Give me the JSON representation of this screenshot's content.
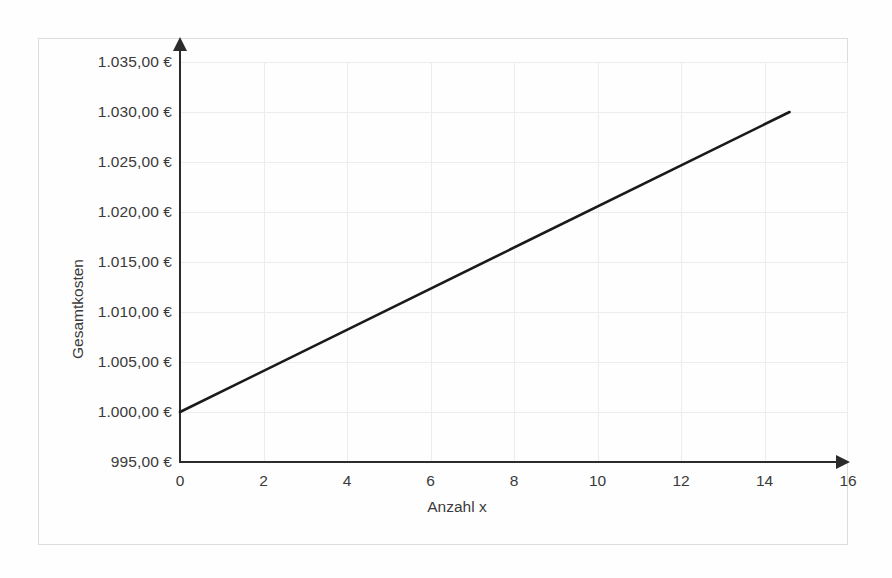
{
  "figure": {
    "background_color": "#fefefe",
    "frame_color": "#dcdcdc",
    "axis_color": "#2b2b2b",
    "grid_color": "#ededed",
    "series_color": "#1a1a1a"
  },
  "chart_data": {
    "type": "line",
    "title": "",
    "xlabel": "Anzahl x",
    "ylabel": "Gesamtkosten",
    "xlim": [
      0,
      16
    ],
    "ylim": [
      995,
      1035
    ],
    "grid": true,
    "legend": null,
    "x_ticks": [
      0,
      2,
      4,
      6,
      8,
      10,
      12,
      14,
      16
    ],
    "x_tick_labels": [
      "0",
      "2",
      "4",
      "6",
      "8",
      "10",
      "12",
      "14",
      "16"
    ],
    "y_ticks": [
      995,
      1000,
      1005,
      1010,
      1015,
      1020,
      1025,
      1030,
      1035
    ],
    "y_tick_labels": [
      "995,00 €",
      "1.000,00 €",
      "1.005,00 €",
      "1.010,00 €",
      "1.015,00 €",
      "1.020,00 €",
      "1.025,00 €",
      "1.030,00 €",
      "1.035,00 €"
    ],
    "series": [
      {
        "name": "Gesamtkosten",
        "color": "#1a1a1a",
        "line_width": 2.6,
        "x": [
          0,
          14.6
        ],
        "values": [
          1000,
          1030
        ],
        "intercept": 1000,
        "slope": 2.055
      }
    ]
  }
}
